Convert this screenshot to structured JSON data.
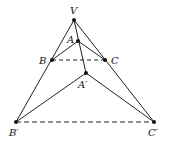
{
  "diagram": {
    "type": "geometry-projection",
    "points": {
      "V": {
        "label": "V",
        "x": 74,
        "y": 20
      },
      "A": {
        "label": "A",
        "x": 78,
        "y": 41
      },
      "B": {
        "label": "B",
        "x": 52,
        "y": 60
      },
      "C": {
        "label": "C",
        "x": 105,
        "y": 60
      },
      "A1": {
        "label": "A′",
        "x": 86,
        "y": 73
      },
      "B1": {
        "label": "B′",
        "x": 16,
        "y": 122
      },
      "C1": {
        "label": "C′",
        "x": 154,
        "y": 122
      }
    },
    "solid_segments": [
      [
        "V",
        "B1"
      ],
      [
        "V",
        "C1"
      ],
      [
        "V",
        "A1"
      ],
      [
        "A",
        "B"
      ],
      [
        "A",
        "C"
      ],
      [
        "A1",
        "B1"
      ],
      [
        "A1",
        "C1"
      ]
    ],
    "dashed_segments": [
      [
        "B",
        "C"
      ],
      [
        "B1",
        "C1"
      ]
    ],
    "line_color": "#222222"
  }
}
